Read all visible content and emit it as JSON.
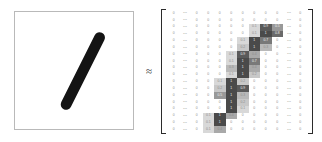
{
  "figure": {
    "caption_present": false,
    "approx_symbol": "≈",
    "accent": "#2b2b2b",
    "panel_border": "#b9b9b9",
    "zero_text_color": "#8d8d8d",
    "filled_text_color": "#f2f2f2"
  },
  "digit_panel": {
    "label": "handwritten-digit-one",
    "stroke_color": "#141414",
    "background": "#ffffff",
    "stroke": {
      "x1": 52,
      "y1": 94,
      "x2": 86,
      "y2": 26,
      "width": 11
    }
  },
  "matrix": {
    "ellipsis": "⋯",
    "zero": "0",
    "columns": 12,
    "rows": 18,
    "ellipsis_columns": [
      1,
      10
    ],
    "grid": [
      [
        "0",
        "⋯",
        "0",
        "0",
        "0",
        "0",
        "0",
        "0",
        "0",
        "0",
        "⋯",
        "0"
      ],
      [
        "0",
        "⋯",
        "0",
        "0",
        "0",
        "0",
        "0",
        "0",
        "0",
        "0",
        "⋯",
        "0"
      ],
      [
        "0",
        "⋯",
        "0",
        "0",
        "0",
        "0",
        "0",
        "0.1",
        "0.9",
        "0.5",
        "⋯",
        "0"
      ],
      [
        "0",
        "⋯",
        "0",
        "0",
        "0",
        "0",
        "0",
        "0.1",
        "1",
        "0.8",
        "⋯",
        "0"
      ],
      [
        "0",
        "⋯",
        "0",
        "0",
        "0",
        "0",
        "0.1",
        "1",
        "0.7",
        "0",
        "⋯",
        "0"
      ],
      [
        "0",
        "⋯",
        "0",
        "0",
        "0",
        "0",
        "0.2",
        "1",
        "0.3",
        "0",
        "⋯",
        "0"
      ],
      [
        "0",
        "⋯",
        "0",
        "0",
        "0",
        "0.1",
        "0.9",
        "0.4",
        "0",
        "0",
        "⋯",
        "0"
      ],
      [
        "0",
        "⋯",
        "0",
        "0",
        "0",
        "0.1",
        "1",
        "0.7",
        "0",
        "0",
        "⋯",
        "0"
      ],
      [
        "0",
        "⋯",
        "0",
        "0",
        "0",
        "0.3",
        "1",
        "0.4",
        "0",
        "0",
        "⋯",
        "0"
      ],
      [
        "0",
        "⋯",
        "0",
        "0",
        "0",
        "0.1",
        "1",
        "0.2",
        "0",
        "0",
        "⋯",
        "0"
      ],
      [
        "0",
        "⋯",
        "0",
        "0",
        "0.1",
        "1",
        "0.2",
        "0",
        "0",
        "0",
        "⋯",
        "0"
      ],
      [
        "0",
        "⋯",
        "0",
        "0",
        "0.2",
        "1",
        "0.9",
        "0",
        "0",
        "0",
        "⋯",
        "0"
      ],
      [
        "0",
        "⋯",
        "0",
        "0",
        "0.5",
        "1",
        "0.3",
        "0",
        "0",
        "0",
        "⋯",
        "0"
      ],
      [
        "0",
        "⋯",
        "0",
        "0",
        "0",
        "1",
        "0.2",
        "0",
        "0",
        "0",
        "⋯",
        "0"
      ],
      [
        "0",
        "⋯",
        "0",
        "0",
        "0",
        "1",
        "0.1",
        "0",
        "0",
        "0",
        "⋯",
        "0"
      ],
      [
        "0",
        "⋯",
        "0",
        "0.1",
        "1",
        "0.4",
        "0",
        "0",
        "0",
        "0",
        "⋯",
        "0"
      ],
      [
        "0",
        "⋯",
        "0",
        "0.1",
        "1",
        "0",
        "0",
        "0",
        "0",
        "0",
        "⋯",
        "0"
      ],
      [
        "0",
        "⋯",
        "0",
        "0.1",
        "0.4",
        "0",
        "0",
        "0",
        "0",
        "0",
        "⋯",
        "0"
      ]
    ],
    "intensity": [
      [
        0,
        0,
        0,
        0,
        0,
        0,
        0,
        0,
        0,
        0,
        0,
        0
      ],
      [
        0,
        0,
        0,
        0,
        0,
        0,
        0,
        0,
        0,
        0,
        0,
        0
      ],
      [
        0,
        0,
        0,
        0,
        0,
        0,
        0,
        0.1,
        0.9,
        0.5,
        0,
        0
      ],
      [
        0,
        0,
        0,
        0,
        0,
        0,
        0,
        0.1,
        1,
        0.8,
        0,
        0
      ],
      [
        0,
        0,
        0,
        0,
        0,
        0,
        0.1,
        1,
        0.7,
        0,
        0,
        0
      ],
      [
        0,
        0,
        0,
        0,
        0,
        0,
        0.2,
        1,
        0.3,
        0,
        0,
        0
      ],
      [
        0,
        0,
        0,
        0,
        0,
        0.1,
        0.9,
        0.4,
        0,
        0,
        0,
        0
      ],
      [
        0,
        0,
        0,
        0,
        0,
        0.1,
        1,
        0.7,
        0,
        0,
        0,
        0
      ],
      [
        0,
        0,
        0,
        0,
        0,
        0.3,
        1,
        0.4,
        0,
        0,
        0,
        0
      ],
      [
        0,
        0,
        0,
        0,
        0,
        0.1,
        1,
        0.2,
        0,
        0,
        0,
        0
      ],
      [
        0,
        0,
        0,
        0,
        0.1,
        1,
        0.2,
        0,
        0,
        0,
        0,
        0
      ],
      [
        0,
        0,
        0,
        0,
        0.2,
        1,
        0.9,
        0,
        0,
        0,
        0,
        0
      ],
      [
        0,
        0,
        0,
        0,
        0.5,
        1,
        0.3,
        0,
        0,
        0,
        0,
        0
      ],
      [
        0,
        0,
        0,
        0,
        0,
        1,
        0.2,
        0,
        0,
        0,
        0,
        0
      ],
      [
        0,
        0,
        0,
        0,
        0,
        1,
        0.1,
        0,
        0,
        0,
        0,
        0
      ],
      [
        0,
        0,
        0,
        0.1,
        1,
        0.4,
        0,
        0,
        0,
        0,
        0,
        0
      ],
      [
        0,
        0,
        0,
        0.1,
        1,
        0,
        0,
        0,
        0,
        0,
        0,
        0
      ],
      [
        0,
        0,
        0,
        0.1,
        0.4,
        0,
        0,
        0,
        0,
        0,
        0,
        0
      ]
    ]
  }
}
